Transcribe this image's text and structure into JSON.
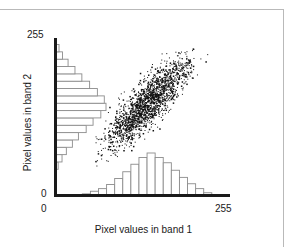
{
  "figure": {
    "kind": "scattergram",
    "frame_color": "#b9b9b9",
    "axis_color": "#1a1a1a",
    "histogram_outline_color": "#8c8c8c",
    "point_color": "#111111"
  },
  "axes": {
    "x": {
      "title": "Pixel values in band 1",
      "min_label": "0",
      "max_label": "255"
    },
    "y": {
      "title": "Pixel values in band 2",
      "min_label": "0",
      "max_label": "255"
    }
  },
  "chart_data": {
    "type": "scatter",
    "title": "",
    "xlabel": "Pixel values in band 1",
    "ylabel": "Pixel values in band 2",
    "xlim": [
      0,
      255
    ],
    "ylim": [
      0,
      255
    ],
    "xticks": [
      0,
      255
    ],
    "yticks": [
      0,
      255
    ],
    "xticklabels": [
      "0",
      "255"
    ],
    "yticklabels": [
      "0",
      "255"
    ],
    "grid": false,
    "legend": null,
    "series": [
      {
        "name": "pixels",
        "marker": "point",
        "color": "#111111",
        "n_points": 1800,
        "cluster": {
          "shape": "elongated ellipse along positive diagonal",
          "x_mean": 135,
          "y_mean": 150,
          "x_std": 32,
          "y_std": 38,
          "correlation": 0.86,
          "x_range": [
            55,
            225
          ],
          "y_range": [
            48,
            240
          ]
        }
      }
    ],
    "marginal_histograms": {
      "band1": {
        "orientation": "vertical-bars-along-x",
        "bin_centers": [
          45,
          57,
          69,
          81,
          93,
          105,
          117,
          129,
          141,
          153,
          165,
          177,
          189,
          201,
          213,
          225
        ],
        "counts": [
          3,
          10,
          17,
          28,
          44,
          62,
          82,
          100,
          112,
          100,
          86,
          66,
          47,
          30,
          17,
          6
        ],
        "max_count": 112
      },
      "band2": {
        "orientation": "horizontal-bars-along-y",
        "bin_centers": [
          48,
          60,
          72,
          84,
          96,
          108,
          120,
          132,
          144,
          156,
          168,
          180,
          192,
          204,
          216,
          228,
          240
        ],
        "counts": [
          5,
          14,
          24,
          38,
          52,
          70,
          86,
          104,
          116,
          112,
          96,
          78,
          60,
          44,
          28,
          15,
          7
        ],
        "max_count": 116
      }
    }
  }
}
